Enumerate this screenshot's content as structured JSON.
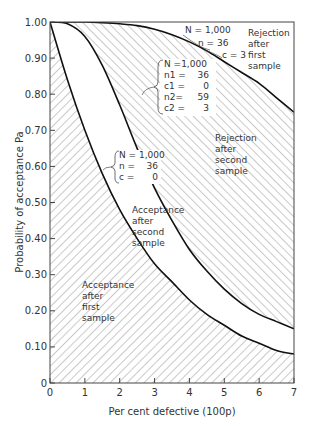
{
  "chart_data": {
    "type": "line",
    "title": "",
    "xlabel": "Per cent defective (100p)",
    "ylabel": "Probability of acceptance  Pa",
    "xlim": [
      0,
      7
    ],
    "ylim": [
      0,
      1.0
    ],
    "x_ticks": [
      "0",
      "1",
      "2",
      "3",
      "4",
      "5",
      "6",
      "7"
    ],
    "y_ticks": [
      "0",
      "0.10",
      "0.20",
      "0.30",
      "0.40",
      "0.50",
      "0.60",
      "0.70",
      "0.80",
      "0.90",
      "1.00"
    ],
    "grid": false,
    "series": [
      {
        "name": "Single sample N=1,000 n=36 c=0",
        "x": [
          0,
          0.5,
          1.0,
          1.5,
          2.0,
          2.5,
          3.0,
          3.5,
          4.0,
          4.5,
          5.0,
          5.5,
          6.0,
          6.5,
          7.0
        ],
        "y": [
          1.0,
          0.84,
          0.7,
          0.58,
          0.48,
          0.4,
          0.33,
          0.28,
          0.23,
          0.19,
          0.16,
          0.13,
          0.11,
          0.09,
          0.08
        ]
      },
      {
        "name": "Double sample N=1,000 n1=36 c1=0 n2=59 c2=3",
        "x": [
          0,
          0.5,
          1.0,
          1.5,
          2.0,
          2.5,
          3.0,
          3.5,
          4.0,
          4.5,
          5.0,
          5.5,
          6.0,
          6.5,
          7.0
        ],
        "y": [
          1.0,
          0.995,
          0.96,
          0.88,
          0.77,
          0.65,
          0.54,
          0.45,
          0.37,
          0.31,
          0.26,
          0.22,
          0.19,
          0.17,
          0.15
        ]
      },
      {
        "name": "Single sample N=1,000 n=36 c=3",
        "x": [
          0,
          0.5,
          1.0,
          1.5,
          2.0,
          2.5,
          3.0,
          3.5,
          4.0,
          4.5,
          5.0,
          5.5,
          6.0,
          6.5,
          7.0
        ],
        "y": [
          1.0,
          1.0,
          1.0,
          0.998,
          0.995,
          0.99,
          0.98,
          0.965,
          0.945,
          0.92,
          0.89,
          0.86,
          0.83,
          0.79,
          0.75
        ]
      }
    ],
    "annotations": {
      "reject_first": [
        "Rejection",
        "after",
        "first",
        "sample"
      ],
      "reject_second": [
        "Rejection",
        "after",
        "second",
        "sample"
      ],
      "accept_second": [
        "Acceptance",
        "after",
        "second",
        "sample"
      ],
      "accept_first": [
        "Acceptance",
        "after",
        "first",
        "sample"
      ],
      "label_c3": [
        "N = 1,000",
        "n = 36",
        "c = 3"
      ],
      "label_double": [
        "N =1,000",
        "n1 =",
        "36",
        "c1 =",
        "0",
        "n2=",
        "59",
        "c2 =",
        "3"
      ],
      "label_c0": [
        "N = 1,000",
        "n =",
        "36",
        "c =",
        "0"
      ]
    }
  }
}
